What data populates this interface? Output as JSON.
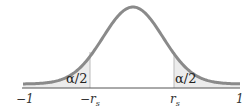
{
  "chart_data": {
    "type": "area",
    "title": "",
    "x_ticks": [
      "-1",
      "-r_s",
      "r_s",
      "1"
    ],
    "xlim": [
      -1,
      1
    ],
    "tail_labels": [
      "α/2",
      "α/2"
    ],
    "shaded_regions": [
      {
        "from": "-1",
        "to": "-r_s"
      },
      {
        "from": "r_s",
        "to": "1"
      }
    ],
    "colors": {
      "curve": "#8a8a8a",
      "shade": "#ececec",
      "axis": "#555555"
    }
  },
  "labels": {
    "tick_neg_one": "−1",
    "tick_neg_rs": "−r",
    "tick_pos_rs": "r",
    "sub_s": "s",
    "tick_one": "1",
    "alpha_left": "α/2",
    "alpha_right": "α/2"
  }
}
